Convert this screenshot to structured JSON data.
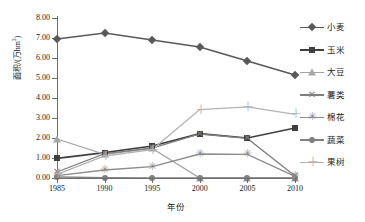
{
  "chart_data": {
    "type": "line",
    "title": "",
    "xlabel": "年份",
    "ylabel": "面积/(万hm2)",
    "ylabel_main": "面积/(万hm",
    "ylabel_sup": "2",
    "ylabel_tail": ")",
    "categories": [
      "1985",
      "1990",
      "1995",
      "2000",
      "2005",
      "2010"
    ],
    "x": [
      1985,
      1990,
      1995,
      2000,
      2005,
      2010
    ],
    "ylim": [
      0.0,
      8.0
    ],
    "ytick_step": 1.0,
    "yticks": [
      "0.00",
      "1.00",
      "2.00",
      "3.00",
      "4.00",
      "5.00",
      "6.00",
      "7.00",
      "8.00"
    ],
    "grid": false,
    "legend_position": "right",
    "series": [
      {
        "name": "小麦",
        "marker": "diamond",
        "color": "#595959",
        "values": [
          6.95,
          7.25,
          6.9,
          6.55,
          5.85,
          5.15
        ]
      },
      {
        "name": "玉米",
        "marker": "square",
        "color": "#3f3f3f",
        "values": [
          0.98,
          1.27,
          1.6,
          2.22,
          2.0,
          2.5
        ]
      },
      {
        "name": "大豆",
        "marker": "triangle",
        "color": "#a6a6a6",
        "values": [
          1.95,
          1.18,
          1.48,
          0.0,
          0.0,
          0.0
        ]
      },
      {
        "name": "薯类",
        "marker": "x",
        "color": "#7f7f7f",
        "values": [
          0.3,
          1.22,
          1.5,
          2.2,
          1.98,
          0.1
        ]
      },
      {
        "name": "棉花",
        "marker": "star",
        "color": "#8c8c8c",
        "values": [
          0.12,
          0.4,
          0.57,
          1.2,
          1.18,
          0.08
        ]
      },
      {
        "name": "蔬菜",
        "marker": "circle",
        "color": "#808080",
        "values": [
          0.05,
          0.02,
          0.0,
          0.0,
          0.0,
          0.0
        ]
      },
      {
        "name": "果树",
        "marker": "plus",
        "color": "#b3b3b3",
        "values": [
          0.18,
          1.1,
          1.42,
          3.42,
          3.56,
          3.18
        ]
      }
    ]
  },
  "legend": {
    "items": [
      {
        "label": "小麦"
      },
      {
        "label": "玉米"
      },
      {
        "label": "大豆"
      },
      {
        "label": "薯类"
      },
      {
        "label": "棉花"
      },
      {
        "label": "蔬菜"
      },
      {
        "label": "果树"
      }
    ]
  },
  "axes": {
    "x_title": "年份",
    "y_title_main": "面积/(万hm",
    "y_title_sup": "2",
    "y_title_tail": ")"
  }
}
